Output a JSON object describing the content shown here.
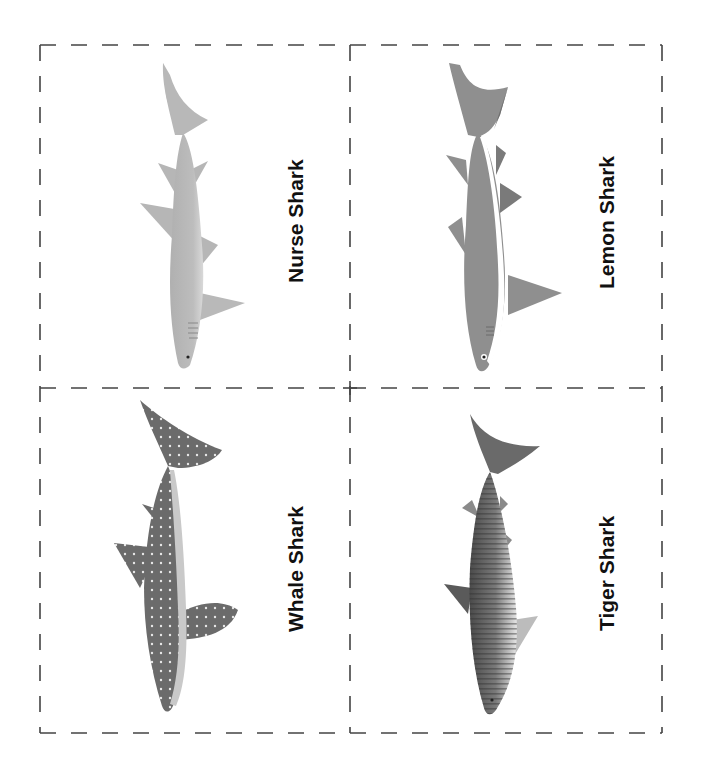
{
  "sheet": {
    "title": "Shark cards",
    "border_color": "#444444",
    "cards": [
      {
        "label": "Nurse Shark",
        "position": "top-left",
        "body_color": "#b9b9b9",
        "belly_color": "#d8d8d8"
      },
      {
        "label": "Lemon Shark",
        "position": "top-right",
        "body_color": "#8f8f8f",
        "belly_color": "#ffffff"
      },
      {
        "label": "Whale Shark",
        "position": "bottom-left",
        "body_color": "#6b6b6b",
        "belly_color": "#c9c9c9"
      },
      {
        "label": "Tiger Shark",
        "position": "bottom-right",
        "body_color": "#5a5a5a",
        "belly_color": "#e2e2e2"
      }
    ]
  }
}
